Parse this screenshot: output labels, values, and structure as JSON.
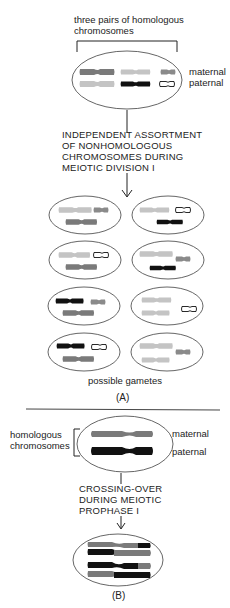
{
  "figure": {
    "panel_a": {
      "label": "(A)",
      "top_caption_line1": "three pairs of homologous",
      "top_caption_line2": "chromosomes",
      "row_label_maternal": "maternal",
      "row_label_paternal": "paternal",
      "process_line1": "INDEPENDENT ASSORTMENT",
      "process_line2": "OF NONHOMOLOGOUS",
      "process_line3": "CHROMOSOMES DURING",
      "process_line4": "MEIOTIC DIVISION I",
      "gametes_caption": "possible gametes",
      "gamete_count": 8
    },
    "panel_b": {
      "label": "(B)",
      "side_label_line1": "homologous",
      "side_label_line2": "chromosomes",
      "row_label_maternal": "maternal",
      "row_label_paternal": "paternal",
      "process_line1": "CROSSING-OVER",
      "process_line2": "DURING MEIOTIC",
      "process_line3": "PROPHASE I"
    },
    "colors": {
      "maternal_large": "#7a7a7a",
      "paternal_large": "#c4c4c4",
      "maternal_medium": "#c4c4c4",
      "paternal_medium": "#111111",
      "maternal_small": "#8a8a8a",
      "paternal_small": "outline",
      "crossover_maternal": "#7a7a7a",
      "crossover_paternal": "#111111"
    }
  }
}
